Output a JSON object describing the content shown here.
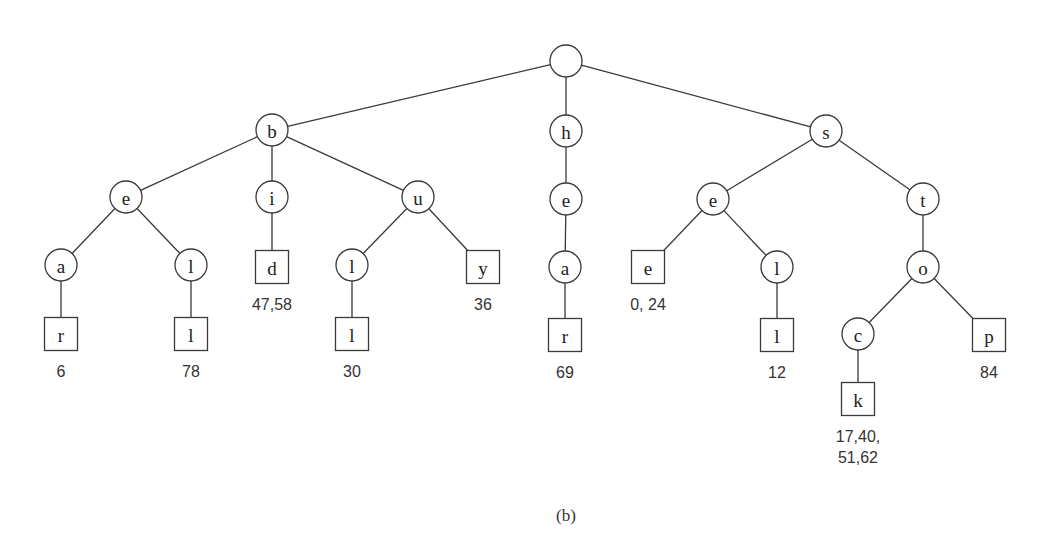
{
  "figure": {
    "caption": "(b)",
    "type": "trie"
  },
  "nodes": [
    {
      "id": "root",
      "label": "",
      "shape": "circle",
      "x": 566,
      "y": 61,
      "r": 16
    },
    {
      "id": "b",
      "label": "b",
      "shape": "circle",
      "x": 272,
      "y": 130,
      "r": 16,
      "parent": "root"
    },
    {
      "id": "h",
      "label": "h",
      "shape": "circle",
      "x": 566,
      "y": 131,
      "r": 16,
      "parent": "root"
    },
    {
      "id": "s",
      "label": "s",
      "shape": "circle",
      "x": 826,
      "y": 131,
      "r": 16,
      "parent": "root"
    },
    {
      "id": "b-e",
      "label": "e",
      "shape": "circle",
      "x": 126,
      "y": 197,
      "r": 16,
      "parent": "b"
    },
    {
      "id": "b-i",
      "label": "i",
      "shape": "circle",
      "x": 272,
      "y": 197,
      "r": 16,
      "parent": "b"
    },
    {
      "id": "b-u",
      "label": "u",
      "shape": "circle",
      "x": 418,
      "y": 197,
      "r": 16,
      "parent": "b"
    },
    {
      "id": "h-e",
      "label": "e",
      "shape": "circle",
      "x": 566,
      "y": 199,
      "r": 16,
      "parent": "h"
    },
    {
      "id": "s-e",
      "label": "e",
      "shape": "circle",
      "x": 713,
      "y": 199,
      "r": 16,
      "parent": "s"
    },
    {
      "id": "s-t",
      "label": "t",
      "shape": "circle",
      "x": 923,
      "y": 199,
      "r": 16,
      "parent": "s"
    },
    {
      "id": "b-e-a",
      "label": "a",
      "shape": "circle",
      "x": 61,
      "y": 265,
      "r": 16,
      "parent": "b-e"
    },
    {
      "id": "b-e-l",
      "label": "l",
      "shape": "circle",
      "x": 191,
      "y": 265,
      "r": 16,
      "parent": "b-e"
    },
    {
      "id": "b-i-d",
      "label": "d",
      "shape": "square",
      "x": 272,
      "y": 267,
      "size": 33,
      "parent": "b-i",
      "positions": "47,58"
    },
    {
      "id": "b-u-l",
      "label": "l",
      "shape": "circle",
      "x": 352,
      "y": 265,
      "r": 16,
      "parent": "b-u"
    },
    {
      "id": "b-u-y",
      "label": "y",
      "shape": "square",
      "x": 483,
      "y": 267,
      "size": 33,
      "parent": "b-u",
      "positions": "36"
    },
    {
      "id": "h-e-a",
      "label": "a",
      "shape": "circle",
      "x": 565,
      "y": 267,
      "r": 16,
      "parent": "h-e"
    },
    {
      "id": "s-e-e",
      "label": "e",
      "shape": "square",
      "x": 648,
      "y": 267,
      "size": 33,
      "parent": "s-e",
      "positions": "0, 24"
    },
    {
      "id": "s-e-l",
      "label": "l",
      "shape": "circle",
      "x": 777,
      "y": 267,
      "r": 16,
      "parent": "s-e"
    },
    {
      "id": "s-t-o",
      "label": "o",
      "shape": "circle",
      "x": 923,
      "y": 267,
      "r": 16,
      "parent": "s-t"
    },
    {
      "id": "b-e-a-r",
      "label": "r",
      "shape": "square",
      "x": 61,
      "y": 334,
      "size": 33,
      "parent": "b-e-a",
      "positions": "6"
    },
    {
      "id": "b-e-l-l",
      "label": "l",
      "shape": "square",
      "x": 191,
      "y": 334,
      "size": 33,
      "parent": "b-e-l",
      "positions": "78"
    },
    {
      "id": "b-u-l-l",
      "label": "l",
      "shape": "square",
      "x": 352,
      "y": 334,
      "size": 33,
      "parent": "b-u-l",
      "positions": "30"
    },
    {
      "id": "h-e-a-r",
      "label": "r",
      "shape": "square",
      "x": 565,
      "y": 335,
      "size": 33,
      "parent": "h-e-a",
      "positions": "69"
    },
    {
      "id": "s-e-l-l",
      "label": "l",
      "shape": "square",
      "x": 777,
      "y": 335,
      "size": 33,
      "parent": "s-e-l",
      "positions": "12"
    },
    {
      "id": "s-t-o-c",
      "label": "c",
      "shape": "circle",
      "x": 858,
      "y": 334,
      "r": 16,
      "parent": "s-t-o"
    },
    {
      "id": "s-t-o-p",
      "label": "p",
      "shape": "square",
      "x": 989,
      "y": 335,
      "size": 33,
      "parent": "s-t-o",
      "positions": "84"
    },
    {
      "id": "s-t-o-c-k",
      "label": "k",
      "shape": "square",
      "x": 858,
      "y": 399,
      "size": 33,
      "parent": "s-t-o-c",
      "positions": "17,40,\n51,62"
    }
  ],
  "words": [
    {
      "word": "bear",
      "positions": "6"
    },
    {
      "word": "bell",
      "positions": "78"
    },
    {
      "word": "bid",
      "positions": "47,58"
    },
    {
      "word": "bull",
      "positions": "30"
    },
    {
      "word": "buy",
      "positions": "36"
    },
    {
      "word": "hear",
      "positions": "69"
    },
    {
      "word": "see",
      "positions": "0, 24"
    },
    {
      "word": "sell",
      "positions": "12"
    },
    {
      "word": "stock",
      "positions": "17,40, 51,62"
    },
    {
      "word": "stop",
      "positions": "84"
    }
  ]
}
